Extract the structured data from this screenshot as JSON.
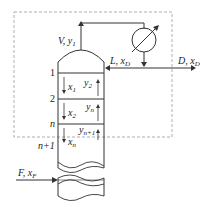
{
  "diagram": {
    "type": "distillation column rectifying section",
    "labels": {
      "vapor_top": "V, y",
      "vapor_top_sub": "1",
      "reflux": "L, x",
      "reflux_sub": "D",
      "distillate": "D, x",
      "distillate_sub": "D",
      "feed": "F, x",
      "feed_sub": "F",
      "plate_1": "1",
      "plate_2": "2",
      "plate_n": "n",
      "plate_n1": "n+1",
      "x1": "x",
      "x1_sub": "1",
      "x2": "x",
      "x2_sub": "2",
      "xn": "x",
      "xn_sub": "n",
      "y2": "y",
      "y2_sub": "2",
      "yn": "y",
      "yn_sub": "n",
      "yn1": "y",
      "yn1_sub": "n+1"
    },
    "components": [
      "column",
      "condenser",
      "control boundary (dashed)"
    ],
    "colors": {
      "line": "#333333",
      "dashed": "#999999"
    }
  }
}
